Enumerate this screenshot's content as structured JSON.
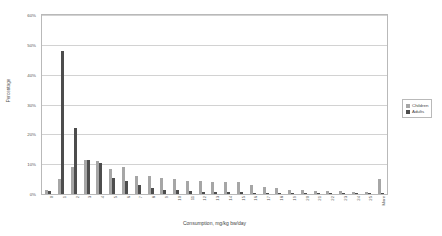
{
  "chart_data": {
    "type": "bar",
    "title": "",
    "xlabel": "Consumption, mg/kg bw/day",
    "ylabel": "Percentage",
    "ylim": [
      0,
      60
    ],
    "yticks": [
      "0%",
      "10%",
      "20%",
      "30%",
      "40%",
      "50%",
      "60%"
    ],
    "ytick_values": [
      0,
      10,
      20,
      30,
      40,
      50,
      60
    ],
    "grid": true,
    "legend_position": "right",
    "categories": [
      "0",
      "1",
      "2",
      "3",
      "4",
      "5",
      "6",
      "7",
      "8",
      "9",
      "10",
      "11",
      "12",
      "13",
      "14",
      "15",
      "16",
      "17",
      "18",
      "19",
      "20",
      "21",
      "22",
      "23",
      "24",
      "25",
      "More"
    ],
    "series": [
      {
        "name": "Children",
        "color": "#a6a6a6",
        "values": [
          1.5,
          5.0,
          9.0,
          11.5,
          11.0,
          8.5,
          9.0,
          6.0,
          6.0,
          5.5,
          5.0,
          4.5,
          4.5,
          4.0,
          4.0,
          4.0,
          3.0,
          2.5,
          2.0,
          1.5,
          1.5,
          1.0,
          1.0,
          1.0,
          0.8,
          0.8,
          5.0
        ]
      },
      {
        "name": "Adults",
        "color": "#4d4d4d",
        "values": [
          1.0,
          48.0,
          22.0,
          11.5,
          10.5,
          5.5,
          4.5,
          3.0,
          2.0,
          1.5,
          1.2,
          1.0,
          0.8,
          0.8,
          0.6,
          0.6,
          0.5,
          0.4,
          0.4,
          0.3,
          0.3,
          0.2,
          0.2,
          0.2,
          0.2,
          0.2,
          0.5
        ]
      }
    ]
  },
  "legend": {
    "items": [
      {
        "label": "Children",
        "color": "#a6a6a6"
      },
      {
        "label": "Adults",
        "color": "#4d4d4d"
      }
    ]
  }
}
